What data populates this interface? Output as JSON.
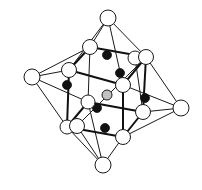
{
  "figure": {
    "colors": {
      "background": "#ffffff",
      "line": "#1a1a1a",
      "white_atom": "#ffffff",
      "black_atom": "#111111",
      "center_atom": "#bbbbbb"
    },
    "atoms": {
      "octahedron_apices": [
        {
          "id": "top",
          "x": 108,
          "y": 18,
          "r": 8
        },
        {
          "id": "left",
          "x": 32,
          "y": 77,
          "r": 8
        },
        {
          "id": "right",
          "x": 181,
          "y": 108,
          "r": 8
        },
        {
          "id": "bottom",
          "x": 103,
          "y": 165,
          "r": 8
        }
      ],
      "cube_corners": [
        {
          "id": "c1",
          "x": 90,
          "y": 47,
          "r": 7.5
        },
        {
          "id": "c2",
          "x": 135,
          "y": 58,
          "r": 7
        },
        {
          "id": "c3",
          "x": 146,
          "y": 57,
          "r": 7.5
        },
        {
          "id": "c4",
          "x": 69,
          "y": 70,
          "r": 7.5
        },
        {
          "id": "c5",
          "x": 123,
          "y": 85,
          "r": 7.5
        },
        {
          "id": "c6",
          "x": 88,
          "y": 102,
          "r": 7
        },
        {
          "id": "c7",
          "x": 143,
          "y": 112,
          "r": 7.5
        },
        {
          "id": "c8",
          "x": 67,
          "y": 127,
          "r": 7
        },
        {
          "id": "c9",
          "x": 77,
          "y": 126,
          "r": 7.5
        },
        {
          "id": "c10",
          "x": 123,
          "y": 137,
          "r": 7.5
        }
      ],
      "black_atoms": [
        {
          "x": 107,
          "y": 55,
          "r": 4.5
        },
        {
          "x": 120,
          "y": 73,
          "r": 4.5
        },
        {
          "x": 67,
          "y": 85,
          "r": 4.5
        },
        {
          "x": 145,
          "y": 98,
          "r": 4.5
        },
        {
          "x": 97,
          "y": 108,
          "r": 4.5
        },
        {
          "x": 105,
          "y": 128,
          "r": 4.5
        }
      ],
      "center_atom": {
        "x": 107,
        "y": 95,
        "r": 5
      }
    }
  }
}
